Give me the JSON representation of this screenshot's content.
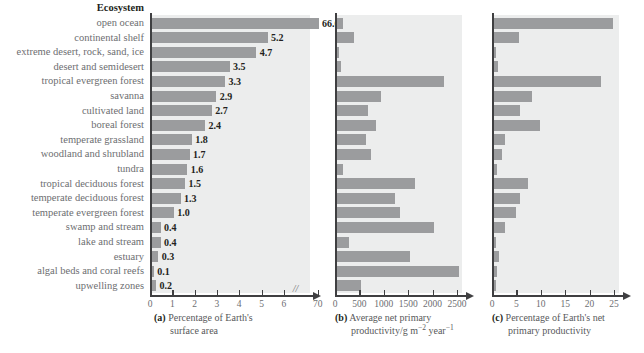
{
  "figure": {
    "row_header": "Ecosystem",
    "bar_color": "#9b9c9e",
    "plot_background": "#eceded",
    "axis_color": "#3f3f41",
    "label_color": "#6d6e71"
  },
  "chart_data": {
    "type": "bar",
    "title": "",
    "categories": [
      "open ocean",
      "continental shelf",
      "extreme desert, rock, sand, ice",
      "desert and semidesert",
      "tropical evergreen forest",
      "savanna",
      "cultivated land",
      "boreal forest",
      "temperate grassland",
      "woodland and shrubland",
      "tundra",
      "tropical deciduous forest",
      "temperate deciduous forest",
      "temperate evergreen forest",
      "swamp and stream",
      "lake and stream",
      "estuary",
      "algal beds and coral reefs",
      "upwelling zones"
    ],
    "panels": [
      {
        "key": "a",
        "tag": "(a)",
        "caption_line1": "Percentage of Earth's",
        "caption_line2": "surface area",
        "xlabel": "Percentage of Earth's surface area",
        "ticks": [
          0,
          1,
          2,
          3,
          4,
          5,
          6,
          70
        ],
        "tick_labels": [
          "0",
          "1",
          "2",
          "3",
          "4",
          "5",
          "6",
          "70"
        ],
        "axis_break": true,
        "axis_break_between": [
          6,
          70
        ],
        "show_value_labels": true,
        "values": [
          66.0,
          5.2,
          4.7,
          3.5,
          3.3,
          2.9,
          2.7,
          2.4,
          1.8,
          1.7,
          1.6,
          1.5,
          1.3,
          1.0,
          0.4,
          0.4,
          0.3,
          0.1,
          0.2
        ],
        "value_labels": [
          "66.0",
          "5.2",
          "4.7",
          "3.5",
          "3.3",
          "2.9",
          "2.7",
          "2.4",
          "1.8",
          "1.7",
          "1.6",
          "1.5",
          "1.3",
          "1.0",
          "0.4",
          "0.4",
          "0.3",
          "0.1",
          "0.2"
        ]
      },
      {
        "key": "b",
        "tag": "(b)",
        "caption_line1": "Average net primary",
        "caption_line2": "productivity/g m<sup>&minus;2</sup> year<sup>&minus;1</sup>",
        "xlabel": "Average net primary productivity / g m^-2 year^-1",
        "ticks": [
          0,
          500,
          1000,
          1500,
          2000,
          2500
        ],
        "tick_labels": [
          "0",
          "500",
          "1000",
          "1500",
          "2000",
          "2500"
        ],
        "axis_break": false,
        "show_value_labels": false,
        "values": [
          125,
          360,
          3,
          90,
          2200,
          900,
          650,
          800,
          600,
          700,
          140,
          1600,
          1200,
          1300,
          2000,
          250,
          1500,
          2500,
          500
        ]
      },
      {
        "key": "c",
        "tag": "(c)",
        "caption_line1": "Percentage of Earth's net",
        "caption_line2": "primary productivity",
        "xlabel": "Percentage of Earth's net primary productivity",
        "ticks": [
          0,
          5,
          10,
          15,
          20,
          25
        ],
        "tick_labels": [
          "0",
          "5",
          "10",
          "15",
          "20",
          "25"
        ],
        "axis_break": false,
        "show_value_labels": false,
        "values": [
          24.4,
          5.2,
          0.04,
          0.9,
          22.0,
          7.9,
          5.4,
          9.6,
          2.4,
          1.7,
          0.6,
          7.1,
          5.4,
          4.5,
          2.3,
          0.3,
          1.1,
          0.6,
          0.1
        ]
      }
    ]
  }
}
